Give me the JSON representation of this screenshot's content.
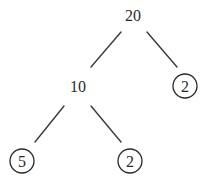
{
  "diagram": {
    "type": "factor-tree",
    "root": {
      "label": "20",
      "circled": false,
      "children": [
        {
          "label": "10",
          "circled": false,
          "children": [
            {
              "label": "5",
              "circled": true
            },
            {
              "label": "2",
              "circled": true
            }
          ]
        },
        {
          "label": "2",
          "circled": true
        }
      ]
    },
    "nodes": {
      "root": "20",
      "intermediate": "10",
      "leaf_right_top": "2",
      "leaf_bottom_left": "5",
      "leaf_bottom_right": "2"
    }
  }
}
